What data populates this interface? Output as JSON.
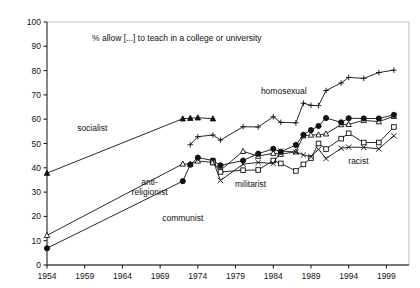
{
  "chart_data": {
    "type": "line",
    "title": "% allow [...] to teach in a college or university",
    "xlabel": "",
    "ylabel": "",
    "xlim": [
      1954,
      2002
    ],
    "ylim": [
      0,
      100
    ],
    "ytick_values": [
      0,
      10,
      20,
      30,
      40,
      50,
      60,
      70,
      80,
      90,
      100
    ],
    "ytick_labels": [
      "0",
      "10",
      "20",
      "30",
      "40",
      "50",
      "60",
      "70",
      "80",
      "90",
      "100"
    ],
    "xtick_values": [
      1954,
      1959,
      1964,
      1969,
      1974,
      1979,
      1984,
      1989,
      1994,
      1999
    ],
    "xtick_labels": [
      "1954",
      "1959",
      "1964",
      "1969",
      "1974",
      "1979",
      "1984",
      "1989",
      "1994",
      "1999"
    ],
    "grid": false,
    "legend_position": "inline-annotations",
    "series": [
      {
        "name": "socialist",
        "marker": "filled-triangle",
        "label_x": 1960.0,
        "label_y": 55.0,
        "x": [
          1954,
          1972,
          1973,
          1974,
          1976
        ],
        "y": [
          37.8,
          60.2,
          60.4,
          60.6,
          60.2
        ]
      },
      {
        "name": "homosexual",
        "marker": "plus",
        "label_x": 1985.4,
        "label_y": 70.3,
        "x": [
          1973,
          1974,
          1976,
          1977,
          1980,
          1982,
          1984,
          1985,
          1987,
          1988,
          1989,
          1990,
          1991,
          1993,
          1994,
          1996,
          1998,
          2000
        ],
        "y": [
          49.5,
          52.8,
          53.5,
          51.4,
          56.9,
          56.8,
          61.0,
          58.7,
          58.5,
          66.6,
          65.7,
          65.6,
          71.8,
          74.9,
          77.2,
          76.8,
          79.2,
          80.2
        ]
      },
      {
        "name": "anti-religionist",
        "marker": "open-triangle",
        "label_x": 1967.6,
        "label_y": 33.0,
        "x": [
          1954,
          1972,
          1973,
          1974,
          1976,
          1977,
          1980,
          1982,
          1984,
          1985,
          1987,
          1988,
          1989,
          1990,
          1991,
          1993,
          1994,
          1996,
          1998,
          2000
        ],
        "y": [
          12.2,
          41.6,
          41.5,
          42.8,
          42.2,
          39.0,
          46.8,
          44.8,
          46.0,
          45.6,
          46.6,
          53.2,
          53.5,
          53.6,
          54.0,
          57.8,
          57.9,
          59.5,
          59.0,
          61.2
        ]
      },
      {
        "name": "communist",
        "marker": "filled-circle",
        "label_x": 1972.0,
        "label_y": 18.2,
        "x": [
          1954,
          1972,
          1973,
          1974,
          1976,
          1977,
          1980,
          1982,
          1984,
          1985,
          1987,
          1988,
          1989,
          1990,
          1991,
          1993,
          1994,
          1996,
          1998,
          2000
        ],
        "y": [
          6.9,
          34.5,
          41.3,
          44.2,
          43.0,
          41.0,
          43.0,
          45.8,
          47.8,
          46.6,
          49.4,
          53.6,
          55.5,
          57.2,
          60.5,
          58.7,
          60.4,
          60.3,
          60.3,
          61.8
        ]
      },
      {
        "name": "militarist",
        "marker": "open-square",
        "label_x": 1981.0,
        "label_y": 32.2,
        "x": [
          1976,
          1977,
          1980,
          1982,
          1984,
          1985,
          1987,
          1988,
          1989,
          1990,
          1991,
          1993,
          1994,
          1996,
          1998,
          2000
        ],
        "y": [
          42.2,
          38.3,
          39.0,
          39.1,
          43.0,
          41.8,
          38.7,
          41.4,
          44.0,
          50.0,
          47.7,
          52.0,
          54.2,
          50.4,
          50.4,
          56.8
        ]
      },
      {
        "name": "racist",
        "marker": "cross-x",
        "label_x": 1995.3,
        "label_y": 41.4,
        "x": [
          1976,
          1977,
          1980,
          1982,
          1984,
          1985,
          1987,
          1988,
          1989,
          1990,
          1991,
          1993,
          1994,
          1996,
          1998,
          2000
        ],
        "y": [
          43.0,
          34.8,
          41.5,
          42.2,
          41.8,
          46.9,
          46.5,
          45.3,
          44.6,
          47.6,
          43.8,
          48.0,
          48.5,
          48.4,
          47.8,
          53.2
        ]
      }
    ]
  },
  "plot_frame": {
    "border_color": "#bdbdbd",
    "axis_color": "#111111"
  }
}
